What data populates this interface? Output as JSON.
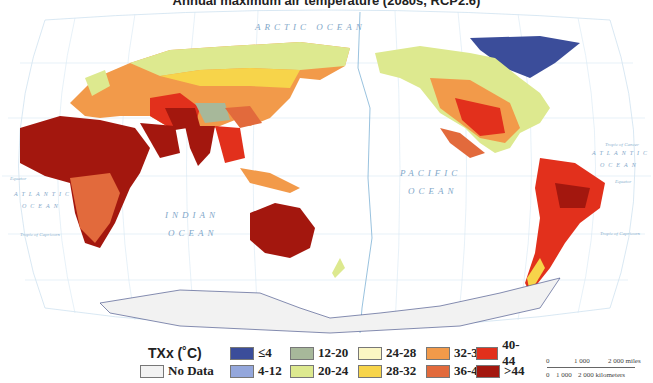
{
  "title": "Annual maximum air temperature (2080s, RCP2.6)",
  "map": {
    "projection": "Robinson, Pacific-centered",
    "ocean_labels": [
      "ARCTIC OCEAN",
      "PACIFIC",
      "OCEAN",
      "INDIAN",
      "OCEAN",
      "ATLANTIC",
      "OCEAN",
      "ATLANTIC",
      "OCEAN"
    ],
    "latitude_lines": [
      "Arctic Circle",
      "Tropic of Cancer",
      "Equator",
      "Tropic of Capricorn",
      "Antarctic Circle"
    ],
    "longitude_ticks": [
      "0°",
      "30°",
      "60°",
      "90°",
      "120°",
      "150°",
      "180° W",
      "150°",
      "120°",
      "90°",
      "60°",
      "30°"
    ],
    "date_line_label": "INTERNATIONAL DATE LINE"
  },
  "legend": {
    "title": "TXx (˚C)",
    "items": [
      {
        "label": "≤4",
        "color": "#3b4d9a"
      },
      {
        "label": "4-12",
        "color": "#94a7dc"
      },
      {
        "label": "12-20",
        "color": "#a7b89a"
      },
      {
        "label": "20-24",
        "color": "#dde98f"
      },
      {
        "label": "24-28",
        "color": "#fbf6c3"
      },
      {
        "label": "28-32",
        "color": "#f7d44a"
      },
      {
        "label": "32-36",
        "color": "#f29a4a"
      },
      {
        "label": "36-40",
        "color": "#e26a3c"
      },
      {
        "label": "40-44",
        "color": "#e2301c"
      },
      {
        "label": "&gt;44",
        "color": "#a3170e"
      },
      {
        "label": "No Data",
        "color": "#f2f2f2"
      }
    ]
  },
  "scale_bar": {
    "miles": [
      "0",
      "1 000",
      "2 000 miles"
    ],
    "km": [
      "0",
      "1 000",
      "2 000 kilometers"
    ]
  }
}
